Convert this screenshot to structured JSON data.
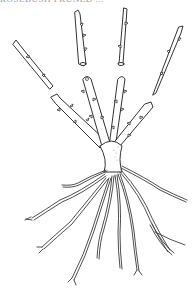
{
  "figure": {
    "caption_clipped": "ROSEBUSH PRUNED ...",
    "colors": {
      "ink": "#333333",
      "background": "#ffffff"
    },
    "parts": {
      "cut_stems": [
        "cut-stem-left",
        "cut-stem-center-left",
        "cut-stem-center-right",
        "cut-stem-right"
      ],
      "remaining_stems": [
        "stem-left",
        "stem-center-left",
        "stem-center-right",
        "stem-right"
      ],
      "crown": "crown",
      "roots": "root-system"
    }
  }
}
